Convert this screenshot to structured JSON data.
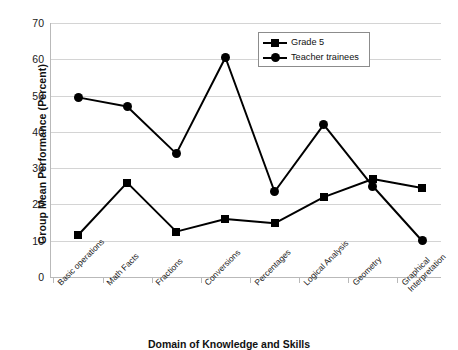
{
  "chart_data": {
    "type": "line",
    "title": "",
    "xlabel": "Domain of Knowledge and Skills",
    "ylabel": "Group Mean Performance (Percent)",
    "categories": [
      "Basic operations",
      "Math Facts",
      "Fractions",
      "Conversions",
      "Percentages",
      "Logical Analysis",
      "Geometry",
      "Graphical Interpretation"
    ],
    "series": [
      {
        "name": "Grade 5",
        "marker": "square",
        "values": [
          11.5,
          26.0,
          12.5,
          16.0,
          14.8,
          22.0,
          27.0,
          24.5
        ]
      },
      {
        "name": "Teacher trainees",
        "marker": "circle",
        "values": [
          49.5,
          47.0,
          34.0,
          60.5,
          23.5,
          42.0,
          25.0,
          10.0
        ]
      }
    ],
    "ylim": [
      0,
      70
    ],
    "yticks": [
      0,
      10,
      20,
      30,
      40,
      50,
      60,
      70
    ],
    "ytick_labels": [
      "0",
      "10",
      "20",
      "30",
      "40",
      "50",
      "60",
      "70"
    ],
    "grid": true,
    "legend_position": "upper-center",
    "line_color": "#000000",
    "grid_color": "#d4d4d4",
    "background_color": "#ffffff"
  },
  "legend": {
    "entries": [
      {
        "label": "Grade 5",
        "marker": "square"
      },
      {
        "label": "Teacher trainees",
        "marker": "circle"
      }
    ]
  },
  "axes": {
    "y_title": "Group Mean Performance (Percent)",
    "x_title": "Domain of Knowledge and Skills"
  }
}
